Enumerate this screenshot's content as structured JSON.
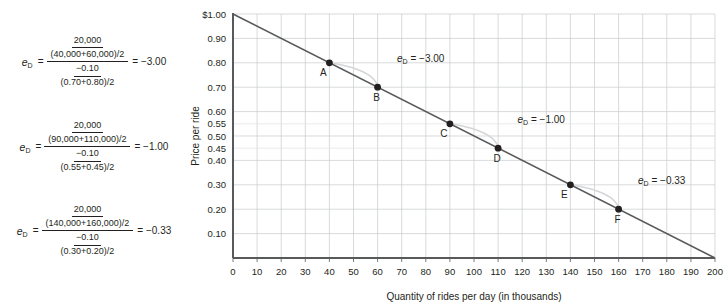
{
  "formulas": [
    {
      "name": "elasticity-calculation-ab",
      "lhs": "e",
      "lhs_sub": "D",
      "equals": "=",
      "numerator_top": "20,000",
      "numerator_bottom": "(40,000+60,000)/2",
      "denominator_top": "−0.10",
      "denominator_bottom": "(0.70+0.80)/2",
      "result": "= −3.00"
    },
    {
      "name": "elasticity-calculation-cd",
      "lhs": "e",
      "lhs_sub": "D",
      "equals": "=",
      "numerator_top": "20,000",
      "numerator_bottom": "(90,000+110,000)/2",
      "denominator_top": "−0.10",
      "denominator_bottom": "(0.55+0.45)/2",
      "result": "= −1.00"
    },
    {
      "name": "elasticity-calculation-ef",
      "lhs": "e",
      "lhs_sub": "D",
      "equals": "=",
      "numerator_top": "20,000",
      "numerator_bottom": "(140,000+160,000)/2",
      "denominator_top": "−0.10",
      "denominator_bottom": "(0.30+0.20)/2",
      "result": "= −0.33"
    }
  ],
  "chart_data": {
    "type": "line",
    "title": "",
    "xlabel": "Quantity of rides per day (in thousands)",
    "ylabel": "Price per ride",
    "xlim": [
      0,
      200
    ],
    "ylim": [
      0,
      1.0
    ],
    "grid": true,
    "legend": "none",
    "xticks": [
      0,
      10,
      20,
      30,
      40,
      50,
      60,
      70,
      80,
      90,
      100,
      110,
      120,
      130,
      140,
      150,
      160,
      170,
      180,
      190,
      200
    ],
    "xticklabels": [
      "0",
      "10",
      "20",
      "30",
      "40",
      "50",
      "60",
      "70",
      "80",
      "90",
      "100",
      "110",
      "120",
      "130",
      "140",
      "150",
      "160",
      "170",
      "180",
      "190",
      "200"
    ],
    "yticks": [
      0.1,
      0.2,
      0.3,
      0.4,
      0.45,
      0.5,
      0.55,
      0.6,
      0.7,
      0.8,
      0.9,
      1.0
    ],
    "yticklabels": [
      "0.10",
      "0.20",
      "0.30",
      "0.40",
      "0.45",
      "0.50",
      "0.55",
      "0.60",
      "0.70",
      "0.80",
      "0.90",
      "$1.00"
    ],
    "series": [
      {
        "name": "demand-curve",
        "color": "#58595b",
        "x": [
          0,
          200
        ],
        "y": [
          1.0,
          0.0
        ]
      }
    ],
    "points": [
      {
        "label": "A",
        "x": 40,
        "y": 0.8,
        "label_dx": -6,
        "label_dy": 13
      },
      {
        "label": "B",
        "x": 60,
        "y": 0.7,
        "label_dx": -1,
        "label_dy": 14
      },
      {
        "label": "C",
        "x": 90,
        "y": 0.55,
        "label_dx": -6,
        "label_dy": 13
      },
      {
        "label": "D",
        "x": 110,
        "y": 0.45,
        "label_dx": -1,
        "label_dy": 14
      },
      {
        "label": "E",
        "x": 140,
        "y": 0.3,
        "label_dx": -6,
        "label_dy": 13
      },
      {
        "label": "F",
        "x": 160,
        "y": 0.2,
        "label_dx": -1,
        "label_dy": 14
      }
    ],
    "annotations": [
      {
        "name": "elasticity-annotation-ab",
        "text": "e",
        "sub": "D",
        "value": "= −3.00",
        "from": "A",
        "to": "B",
        "x": 68,
        "y": 0.805
      },
      {
        "name": "elasticity-annotation-cd",
        "text": "e",
        "sub": "D",
        "value": "= −1.00",
        "from": "C",
        "to": "D",
        "x": 118,
        "y": 0.555
      },
      {
        "name": "elasticity-annotation-ef",
        "text": "e",
        "sub": "D",
        "value": "= −0.33",
        "from": "E",
        "to": "F",
        "x": 168,
        "y": 0.305
      }
    ]
  }
}
